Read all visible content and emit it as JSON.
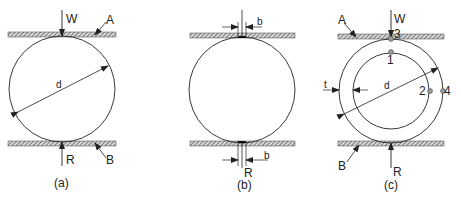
{
  "figure": {
    "panels": [
      {
        "id": "a",
        "caption": "(a)",
        "labels": {
          "load": "W",
          "reaction": "R",
          "top_plate": "A",
          "bottom_plate": "B",
          "diameter": "d"
        }
      },
      {
        "id": "b",
        "caption": "(b)",
        "labels": {
          "contact_width_top": "b",
          "contact_width_bottom": "b",
          "reaction": "R"
        }
      },
      {
        "id": "c",
        "caption": "(c)",
        "labels": {
          "load": "W",
          "reaction": "R",
          "top_plate": "A",
          "bottom_plate": "B",
          "diameter": "d",
          "thickness": "t",
          "point1": "1",
          "point2": "2",
          "point3": "3",
          "point4": "4"
        }
      }
    ],
    "colors": {
      "line": "#222222",
      "hatch": "#555555",
      "point_fill": "#9a9a9a"
    }
  }
}
